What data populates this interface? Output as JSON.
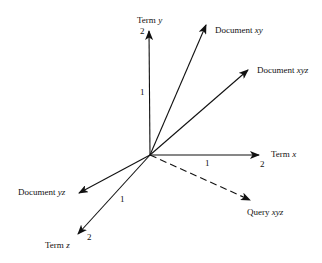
{
  "diagram": {
    "colors": {
      "line": "#111111",
      "background": "#ffffff"
    },
    "origin": [
      150,
      155
    ],
    "axes": {
      "term_y": {
        "word": "Term",
        "var": "y",
        "tick1": "1",
        "tick2": "2"
      },
      "term_x": {
        "word": "Term",
        "var": "x",
        "tick1": "1",
        "tick2": "2"
      },
      "term_z": {
        "word": "Term",
        "var": "z",
        "tick1": "1",
        "tick2": "2"
      }
    },
    "vectors": {
      "doc_xy": {
        "word": "Document",
        "var": "xy",
        "style": "solid"
      },
      "doc_xyz": {
        "word": "Document",
        "var": "xyz",
        "style": "solid"
      },
      "doc_yz": {
        "word": "Document",
        "var": "yz",
        "style": "solid"
      },
      "query_xyz": {
        "word": "Query",
        "var": "xyz",
        "style": "dashed"
      }
    }
  }
}
